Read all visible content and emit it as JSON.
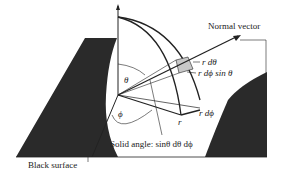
{
  "labels": {
    "normal_vector": "Normal vector",
    "r_dtheta": "r dθ",
    "r_dphi_sin_theta": "r dϕ sin θ",
    "r_dphi": "r dϕ",
    "r": "r",
    "theta": "θ",
    "phi": "ϕ",
    "solid_angle": "Solid angle: sinθ dθ dϕ",
    "black_surface": "Black surface"
  },
  "colors": {
    "surface": "#2a2a2a",
    "shaded_patch": "#c8c8c8",
    "line": "#222222"
  }
}
